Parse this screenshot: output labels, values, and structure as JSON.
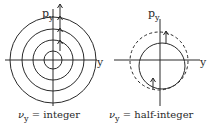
{
  "left_panel": {
    "axis_x_label": "y",
    "axis_y_label_main": "p",
    "axis_y_label_sub": "y",
    "caption_symbol": "ν",
    "caption_sub": "y",
    "caption_rest": " = integer",
    "circle_radii": [
      9,
      20,
      31,
      43
    ],
    "arrow_heads_y": [
      5,
      17,
      30,
      41
    ]
  },
  "right_panel": {
    "axis_x_label": "y",
    "axis_y_label_main": "p",
    "axis_y_label_sub": "y",
    "caption_symbol": "ν",
    "caption_sub": "y",
    "caption_rest": " = half-integer",
    "solid_circle_radius": 22,
    "dashed_circle_radius": 29
  },
  "colors": {
    "line": "#2a2a2a",
    "background": "#ffffff"
  }
}
